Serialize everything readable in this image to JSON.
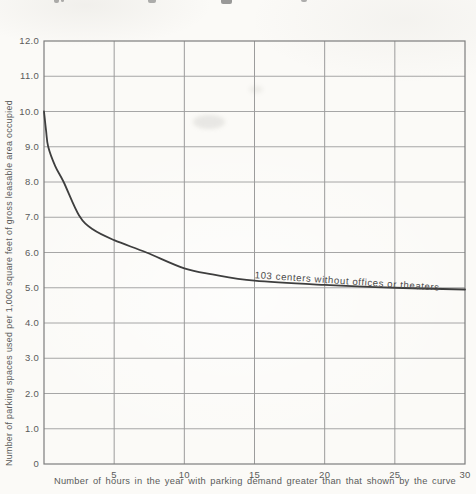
{
  "figure": {
    "background": "#fbfaf7"
  },
  "chart_data": {
    "type": "line",
    "title": "",
    "xlabel": "Number of hours in the year with parking demand greater than that shown by the curve",
    "ylabel": "Number of parking spaces used per 1,000 square feet of gross leasable area occupied",
    "xlim": [
      0,
      30
    ],
    "ylim": [
      0,
      12
    ],
    "grid": true,
    "legend_position": "inline-annotation",
    "xticks": [
      {
        "value": 5,
        "label": "5"
      },
      {
        "value": 10,
        "label": "10"
      },
      {
        "value": 15,
        "label": "15"
      },
      {
        "value": 20,
        "label": "20"
      },
      {
        "value": 25,
        "label": "25"
      },
      {
        "value": 30,
        "label": "30"
      }
    ],
    "yticks": [
      {
        "value": 12,
        "label": "12.0"
      },
      {
        "value": 11,
        "label": "11.0"
      },
      {
        "value": 10,
        "label": "10.0"
      },
      {
        "value": 9,
        "label": "9.0"
      },
      {
        "value": 8,
        "label": "8.0"
      },
      {
        "value": 7,
        "label": "7.0"
      },
      {
        "value": 6,
        "label": "6.0"
      },
      {
        "value": 5,
        "label": "5.0"
      },
      {
        "value": 4,
        "label": "4.0"
      },
      {
        "value": 3,
        "label": "3.0"
      },
      {
        "value": 2,
        "label": "2.0"
      },
      {
        "value": 1,
        "label": "1.0"
      },
      {
        "value": 0,
        "label": "0"
      }
    ],
    "series": [
      {
        "name": "103 centers without offices or theaters",
        "color": "#3e3e3e",
        "points": [
          [
            0,
            10.0
          ],
          [
            0.15,
            9.45
          ],
          [
            0.3,
            9.0
          ],
          [
            0.8,
            8.45
          ],
          [
            1.4,
            8.0
          ],
          [
            2.5,
            7.05
          ],
          [
            3.5,
            6.65
          ],
          [
            5,
            6.35
          ],
          [
            7.3,
            6.0
          ],
          [
            10,
            5.55
          ],
          [
            12,
            5.38
          ],
          [
            15,
            5.2
          ],
          [
            20,
            5.08
          ],
          [
            25,
            5.0
          ],
          [
            30,
            4.95
          ]
        ]
      }
    ],
    "annotation": {
      "text": "103 centers without offices or theaters",
      "x": 15.0,
      "y": 5.27,
      "rotation_deg": 3.8
    }
  },
  "colors": {
    "grid": "#9c9c9c",
    "border": "#7d7d7d",
    "curve": "#3e3e3e",
    "text": "#5a5a5a"
  }
}
